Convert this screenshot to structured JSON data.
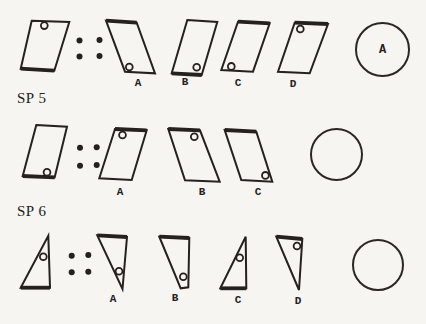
{
  "colors": {
    "background": "#f6f5f2",
    "ink": "#24211e"
  },
  "problems": [
    {
      "label": "SP 5",
      "stimulus": {
        "shape": "parallelogram",
        "lean": "right",
        "marker": "top-left",
        "bold_edge": "bottom"
      },
      "separator": "four-dots",
      "options": [
        {
          "letter": "A",
          "shape": "parallelogram",
          "lean": "left",
          "marker": "bottom-left",
          "bold_edge": "top"
        },
        {
          "letter": "B",
          "shape": "parallelogram",
          "lean": "right",
          "marker": "bottom-right",
          "bold_edge": "bottom"
        },
        {
          "letter": "C",
          "shape": "parallelogram",
          "lean": "right",
          "marker": "bottom-left",
          "bold_edge": "top"
        },
        {
          "letter": "D",
          "shape": "parallelogram",
          "lean": "right",
          "marker": "top-left",
          "bold_edge": "top"
        }
      ],
      "answer": {
        "value": "A"
      }
    },
    {
      "label": "SP 6",
      "stimulus": {
        "shape": "parallelogram",
        "lean": "right",
        "marker": "bottom-right",
        "bold_edge": "bottom"
      },
      "separator": "four-dots",
      "options": [
        {
          "letter": "A",
          "shape": "parallelogram",
          "lean": "right",
          "marker": "top-left",
          "bold_edge": "top"
        },
        {
          "letter": "B",
          "shape": "parallelogram",
          "lean": "left",
          "marker": "top-right",
          "bold_edge": "top"
        },
        {
          "letter": "C",
          "shape": "parallelogram",
          "lean": "left",
          "marker": "bottom-right",
          "bold_edge": "top"
        }
      ],
      "answer": {
        "value": ""
      }
    },
    {
      "label": "",
      "stimulus": {
        "shape": "right-triangle",
        "orientation": "apex-up",
        "marker": "upper-right",
        "bold_edge": "bottom"
      },
      "separator": "four-dots",
      "options": [
        {
          "letter": "A",
          "shape": "right-triangle",
          "orientation": "apex-down",
          "marker": "lower-middle",
          "bold_edge": "top"
        },
        {
          "letter": "B",
          "shape": "truncated-triangle",
          "orientation": "apex-down",
          "marker": "lower-right",
          "bold_edge": "top"
        },
        {
          "letter": "C",
          "shape": "right-triangle",
          "orientation": "apex-up",
          "marker": "upper-right",
          "bold_edge": "bottom"
        },
        {
          "letter": "D",
          "shape": "right-triangle",
          "orientation": "apex-down",
          "marker": "upper-right",
          "bold_edge": "top"
        }
      ],
      "answer": {
        "value": ""
      }
    }
  ]
}
